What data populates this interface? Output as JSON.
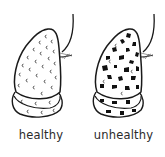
{
  "illustration": {
    "panels": [
      {
        "id": "healthy",
        "label": "healthy",
        "texture": "light-c-marks",
        "fill": "#ffffff"
      },
      {
        "id": "unhealthy",
        "label": "unhealthy",
        "texture": "dark-blotches",
        "fill": "#ffffff",
        "spot_color": "#111111"
      }
    ],
    "line_color": "#1a1a1a"
  }
}
